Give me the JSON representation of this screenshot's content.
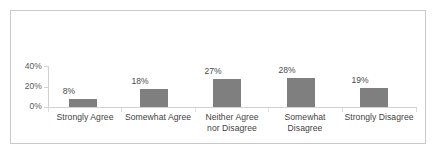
{
  "chart_data": {
    "type": "bar",
    "title": "",
    "subtitle": "",
    "xlabel": "",
    "ylabel": "",
    "categories": [
      "Strongly Agree",
      "Somewhat Agree",
      "Neither Agree nor Disagree",
      "Somewhat Disagree",
      "Strongly Disagree"
    ],
    "category_lines": [
      [
        "Strongly Agree"
      ],
      [
        "Somewhat Agree"
      ],
      [
        "Neither Agree",
        "nor Disagree"
      ],
      [
        "Somewhat",
        "Disagree"
      ],
      [
        "Strongly Disagree"
      ]
    ],
    "values": [
      8,
      18,
      27,
      28,
      19
    ],
    "data_labels": [
      "8%",
      "18%",
      "27%",
      "28%",
      "19%"
    ],
    "ylim": [
      0,
      40
    ],
    "ytick_values": [
      0,
      20,
      40
    ],
    "ytick_labels": [
      "0%",
      "20%",
      "40%"
    ],
    "grid": false,
    "legend": null,
    "bar_color": "#7f7f7f",
    "axis_color": "#d2d2d2",
    "frame_color": "#c9c9c9",
    "text_color": "#3f3f3f",
    "background": "#ffffff"
  }
}
